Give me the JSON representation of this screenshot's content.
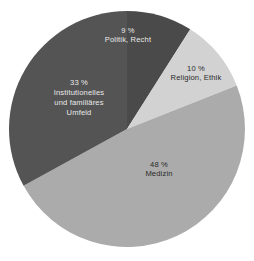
{
  "chart_data": {
    "type": "pie",
    "title": "",
    "subtitle": "",
    "xlabel": "",
    "ylabel": "",
    "legend_position": "none",
    "grid": false,
    "units": "%",
    "start_angle_deg": 0,
    "direction": "clockwise",
    "categories": [
      "Politik, Recht",
      "Religion, Ethik",
      "Medizin",
      "Institutionelles und familiäres Umfeld"
    ],
    "values": [
      9,
      10,
      48,
      33
    ],
    "slices": [
      {
        "id": "politik",
        "percent_text": "9 %",
        "value": 9,
        "name_lines": [
          "Politik, Recht"
        ],
        "color": "#4a4a4a",
        "label_color": "#e9e9e9"
      },
      {
        "id": "religion",
        "percent_text": "10 %",
        "value": 10,
        "name_lines": [
          "Religion, Ethik"
        ],
        "color": "#d2d2d2",
        "label_color": "#2a2a2a"
      },
      {
        "id": "medizin",
        "percent_text": "48 %",
        "value": 48,
        "name_lines": [
          "Medizin"
        ],
        "color": "#ababab",
        "label_color": "#2a2a2a"
      },
      {
        "id": "institutionelles",
        "percent_text": "33 %",
        "value": 33,
        "name_lines": [
          "Institutionelles",
          "und familiäres",
          "Umfeld"
        ],
        "color": "#545454",
        "label_color": "#e9e9e9"
      }
    ],
    "geometry": {
      "center_x": 127,
      "center_y": 129,
      "radius": 118
    }
  },
  "labels": {
    "politik": {
      "percent": "9 %",
      "line1": "Politik, Recht"
    },
    "religion": {
      "percent": "10 %",
      "line1": "Religion, Ethik"
    },
    "medizin": {
      "percent": "48 %",
      "line1": "Medizin"
    },
    "institutionelles": {
      "percent": "33 %",
      "line1": "Institutionelles",
      "line2": "und familiäres",
      "line3": "Umfeld"
    }
  },
  "colors": {
    "background": "#ffffff",
    "slice_politik": "#4a4a4a",
    "slice_religion": "#d2d2d2",
    "slice_medizin": "#ababab",
    "slice_institutionelles": "#545454",
    "label_on_dark": "#e9e9e9",
    "label_on_light": "#2a2a2a"
  }
}
